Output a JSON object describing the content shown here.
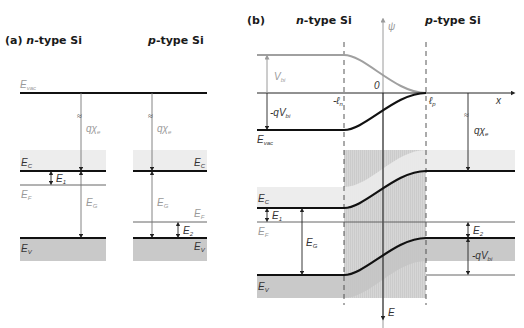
{
  "panel_a": {
    "title_prefix": "(a) ",
    "title_n_italic": "n",
    "title_n_rest": "-type Si",
    "title_p_italic": "p",
    "title_p_rest": "-type Si",
    "labels": {
      "E_vac": "E",
      "E_vac_sub": "vac",
      "n_qchi": "qχ",
      "n_qchi_sub": "e",
      "p_qchi": "qχ",
      "p_qchi_sub": "e",
      "n_Ec": "E",
      "n_Ec_sub": "C",
      "p_Ec": "E",
      "p_Ec_sub": "C",
      "n_E1": "E",
      "n_E1_sub": "1",
      "n_EF": "E",
      "n_EF_sub": "F",
      "p_EF": "E",
      "p_EF_sub": "F",
      "n_EG": "E",
      "n_EG_sub": "G",
      "p_EG": "E",
      "p_EG_sub": "G",
      "p_E2": "E",
      "p_E2_sub": "2",
      "n_Ev": "E",
      "n_Ev_sub": "V",
      "p_Ev": "E",
      "p_Ev_sub": "V",
      "break_mark": "≈"
    }
  },
  "panel_b": {
    "title_prefix": "(b)",
    "title_n_italic": "n",
    "title_n_rest": "-type Si",
    "title_p_italic": "p",
    "title_p_rest": "-type Si",
    "axes": {
      "psi": "ψ",
      "x": "x",
      "origin": "0",
      "minus_ln": "-ℓ",
      "minus_ln_sub": "n",
      "lp": "ℓ",
      "lp_sub": "p",
      "E": "E"
    },
    "labels": {
      "Vbi": "V",
      "Vbi_sub": "bi",
      "minus_qVbi_top": "-qV",
      "minus_qVbi_top_sub": "bi",
      "E_vac": "E",
      "E_vac_sub": "vac",
      "qchi": "qχ",
      "qchi_sub": "e",
      "n_Ec": "E",
      "n_Ec_sub": "C",
      "n_E1": "E",
      "n_E1_sub": "1",
      "n_EF": "E",
      "n_EF_sub": "F",
      "n_EG": "E",
      "n_EG_sub": "G",
      "n_Ev": "E",
      "n_Ev_sub": "V",
      "p_E2": "E",
      "p_E2_sub": "2",
      "minus_qVbi_bottom": "-qV",
      "minus_qVbi_bottom_sub": "bi",
      "break_mark": "≈"
    }
  },
  "colors": {
    "band_line": "#111111",
    "thin_line": "#555555",
    "grey_curve": "#a0a0a0",
    "conduction_shade": "#ededed",
    "valence_shade": "#c9c9c9",
    "depletion_shade": "#d4d4d4"
  }
}
